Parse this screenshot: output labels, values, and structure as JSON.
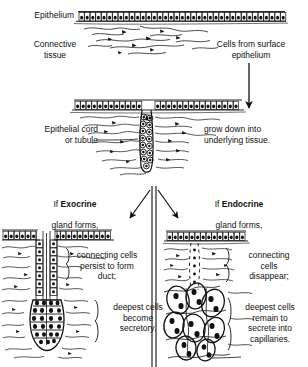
{
  "diagram": {
    "style": {
      "ink": "#111111",
      "paper": "#ffffff"
    },
    "stage1": {
      "label_epithelium": "Epithelium",
      "label_connective_tissue": "Connective\ntissue",
      "label_cells_from_surface": "Cells from surface\nepithelium"
    },
    "stage2": {
      "label_cord": "Epithelial cord\nor tubule",
      "label_grow_down": "grow down into\nunderlying tissue."
    },
    "branch": {
      "left_heading_prefix": "If ",
      "left_heading_bold": "Exocrine",
      "left_heading_suffix": "gland forms,",
      "right_heading_prefix": "If ",
      "right_heading_bold": "Endocrine",
      "right_heading_suffix": "gland forms,"
    },
    "exocrine": {
      "note_connecting": "connecting cells\npersist to form\nduct;",
      "note_deepest": "deepest cells\nbecome\nsecretory."
    },
    "endocrine": {
      "note_connecting": "connecting\ncells\ndisappear;",
      "note_deepest": "deepest cells\nremain to\nsecrete into\ncapillaries."
    }
  }
}
